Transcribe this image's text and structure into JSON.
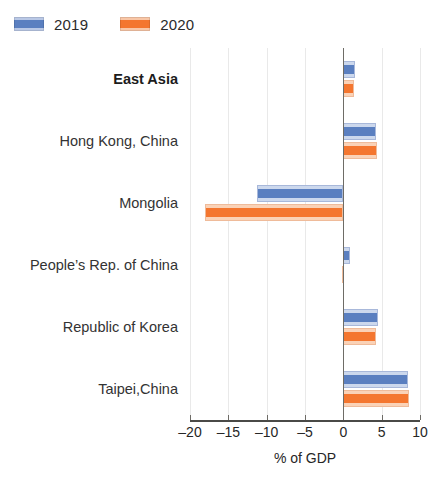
{
  "legend": {
    "entries": [
      {
        "label": "2019",
        "color": "#5a7fc0",
        "swatch": "series-2019"
      },
      {
        "label": "2020",
        "color": "#f4762f",
        "swatch": "series-2020"
      }
    ]
  },
  "axis": {
    "title": "% of GDP",
    "ticklabels": [
      "–20",
      "–15",
      "–10",
      "–5",
      "0",
      "5",
      "10"
    ]
  },
  "chart_data": {
    "type": "bar",
    "orientation": "horizontal",
    "title": "",
    "xlabel": "% of GDP",
    "ylabel": "",
    "xlim": [
      -20,
      10
    ],
    "xticks": [
      -20,
      -15,
      -10,
      -5,
      0,
      5,
      10
    ],
    "grid": true,
    "legend_position": "top-left",
    "categories": [
      "East Asia",
      "Hong Kong, China",
      "Mongolia",
      "People’s Rep. of China",
      "Republic of Korea",
      "Taipei,China"
    ],
    "series": [
      {
        "name": "2019",
        "color": "#5a7fc0",
        "values": [
          1.5,
          4.3,
          -11.2,
          0.9,
          4.5,
          8.4
        ]
      },
      {
        "name": "2020",
        "color": "#f4762f",
        "values": [
          1.4,
          4.4,
          -18.0,
          -0.2,
          4.2,
          8.6
        ]
      }
    ]
  }
}
